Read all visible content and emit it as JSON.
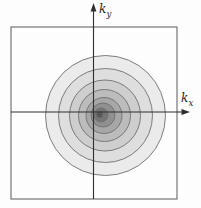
{
  "figure": {
    "x_axis": {
      "base": "k",
      "sub": "x"
    },
    "y_axis": {
      "base": "k",
      "sub": "y"
    },
    "colors": {
      "frame": "#5a5a5a",
      "axis": "#2e2e2e",
      "contour_stroke": "#6f6f6f",
      "inner_background": "#fdfdfd"
    },
    "contours": [
      {
        "r": 60.0,
        "cx": 105.5,
        "cy": 115.5,
        "fill": "#ebebeb"
      },
      {
        "r": 47.0,
        "cx": 105.5,
        "cy": 115.5,
        "fill": "#dedede"
      },
      {
        "r": 35.5,
        "cx": 105.0,
        "cy": 115.5,
        "fill": "#cecece"
      },
      {
        "r": 26.0,
        "cx": 104.5,
        "cy": 115.5,
        "fill": "#bcbcbc"
      },
      {
        "r": 18.0,
        "cx": 104.0,
        "cy": 115.5,
        "fill": "#a7a7a7"
      },
      {
        "r": 12.0,
        "cx": 103.0,
        "cy": 115.0,
        "fill": "#909090"
      },
      {
        "r": 7.0,
        "cx": 101.0,
        "cy": 115.0,
        "fill": "#757575"
      },
      {
        "r": 3.5,
        "cx": 99.5,
        "cy": 114.5,
        "fill": "#555555"
      },
      {
        "r": 1.5,
        "cx": 99.0,
        "cy": 114.5,
        "fill": "#3a3a3a"
      }
    ]
  }
}
